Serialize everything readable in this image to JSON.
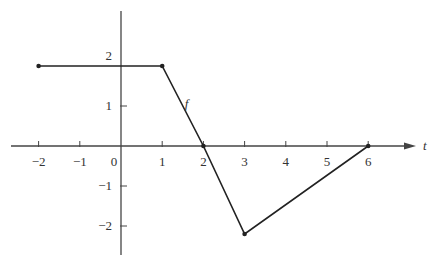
{
  "chart_data": {
    "type": "line",
    "title": "",
    "xlabel": "t",
    "ylabel": "",
    "series": [
      {
        "name": "f",
        "points": [
          [
            -2,
            2
          ],
          [
            1,
            2
          ],
          [
            2,
            0
          ],
          [
            3,
            -2.2
          ],
          [
            6,
            0
          ]
        ]
      }
    ],
    "x_ticks": [
      -2,
      -1,
      0,
      1,
      2,
      3,
      4,
      5,
      6
    ],
    "y_ticks": [
      -2,
      -1,
      1,
      2
    ],
    "xlim": [
      -2.7,
      7.1
    ],
    "ylim": [
      -2.75,
      3.3
    ],
    "grid": false,
    "legend": "none",
    "annotations": [
      {
        "text": "f",
        "x": 1.55,
        "y": 0.95
      }
    ]
  },
  "labels": {
    "x_axis": "t",
    "curve": "f",
    "origin": "0"
  },
  "colors": {
    "line": "#222222",
    "axis": "#444444",
    "background": "#ffffff"
  }
}
